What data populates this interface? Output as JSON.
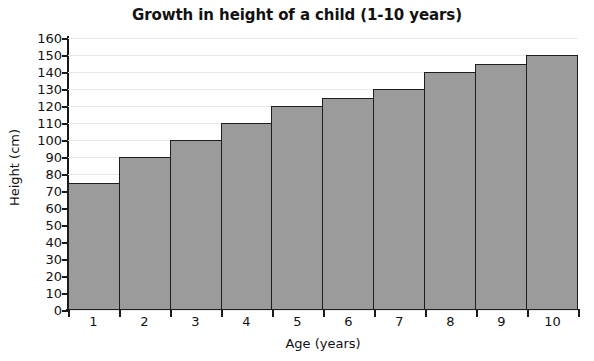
{
  "chart_data": {
    "type": "bar",
    "title": "Growth in height of a child (1-10 years)",
    "xlabel": "Age (years)",
    "ylabel": "Height (cm)",
    "categories": [
      "1",
      "2",
      "3",
      "4",
      "5",
      "6",
      "7",
      "8",
      "9",
      "10"
    ],
    "values": [
      75,
      90,
      100,
      110,
      120,
      125,
      130,
      140,
      145,
      150
    ],
    "ylim": [
      0,
      160
    ],
    "ytick_step": 10,
    "yticks": [
      0,
      10,
      20,
      30,
      40,
      50,
      60,
      70,
      80,
      90,
      100,
      110,
      120,
      130,
      140,
      150,
      160
    ],
    "ytick_labels": [
      "0",
      "10",
      "20",
      "30",
      "40",
      "50",
      "60",
      "70",
      "80",
      "90",
      "100",
      "110",
      "120",
      "130",
      "140",
      "150",
      "160"
    ],
    "grid": true,
    "legend": null,
    "bar_fill_color": "#9b9b9b",
    "bar_edge_color": "#1e1e1e",
    "gridline_color": "#e9e9e9",
    "axis_color": "#1a1a1a",
    "background_color": "#ffffff"
  }
}
